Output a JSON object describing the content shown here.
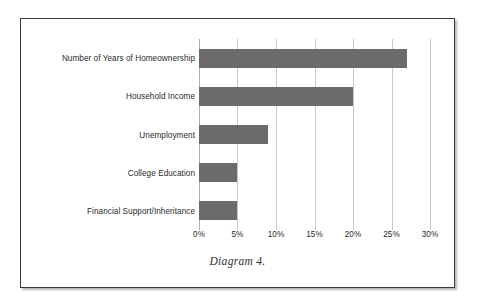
{
  "figure": {
    "caption": "Diagram 4.",
    "frame_color": "#3a3a3a",
    "background": "#ffffff"
  },
  "chart_data": {
    "type": "bar",
    "orientation": "horizontal",
    "title": "",
    "subtitle": "",
    "xlabel": "",
    "ylabel": "",
    "categories": [
      "Number of Years of Homeownership",
      "Household Income",
      "Unemployment",
      "College Education",
      "Financial Support/Inheritance"
    ],
    "values": [
      27,
      20,
      9,
      5,
      5
    ],
    "value_unit": "%",
    "xlim": [
      0,
      30
    ],
    "xticks": [
      0,
      5,
      10,
      15,
      20,
      25,
      30
    ],
    "xtick_labels": [
      "0%",
      "5%",
      "10%",
      "15%",
      "20%",
      "25%",
      "30%"
    ],
    "grid": true,
    "grid_axis": "x",
    "legend": false,
    "bar_color": "#6b6b6b",
    "gridline_color": "#c8c8c8"
  }
}
